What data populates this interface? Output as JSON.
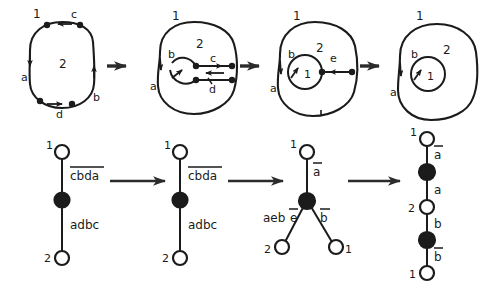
{
  "figure": {
    "row_top": {
      "steps": [
        {
          "id": "top-step-1",
          "region_outer": "1",
          "region_inner": "2",
          "edge_labels": [
            "c",
            "a",
            "b",
            "d"
          ],
          "vertices": 4
        },
        {
          "id": "top-step-2",
          "region_outer": "1",
          "region_inner": "2",
          "edge_labels": [
            "b",
            "c",
            "a",
            "d"
          ],
          "vertices": 4
        },
        {
          "id": "top-step-3",
          "region_outer": "1",
          "region_inner": "2",
          "region_core": "1",
          "edge_labels": [
            "b",
            "e",
            "a"
          ],
          "vertices": 2
        },
        {
          "id": "top-step-4",
          "region_outer": "1",
          "region_inner": "2",
          "region_core": "1",
          "edge_labels": [
            "b",
            "a"
          ],
          "vertices": 0
        }
      ],
      "arrows": [
        "arrow-top-1",
        "arrow-top-2",
        "arrow-top-3"
      ]
    },
    "row_bottom": {
      "steps": [
        {
          "id": "bottom-step-1",
          "type": "chain",
          "nodes": [
            {
              "label": "1",
              "fill": "open"
            },
            {
              "label": "",
              "fill": "solid"
            },
            {
              "label": "2",
              "fill": "open"
            }
          ],
          "edges": [
            {
              "label": "cbda",
              "overline": true
            },
            {
              "label": "adbc",
              "overline": false
            }
          ]
        },
        {
          "id": "bottom-step-2",
          "type": "chain",
          "nodes": [
            {
              "label": "1",
              "fill": "open"
            },
            {
              "label": "",
              "fill": "solid"
            },
            {
              "label": "2",
              "fill": "open"
            }
          ],
          "edges": [
            {
              "label": "cbda",
              "overline": true
            },
            {
              "label": "adbc",
              "overline": false
            }
          ]
        },
        {
          "id": "bottom-step-3",
          "type": "star",
          "nodes": [
            {
              "label": "1",
              "fill": "open",
              "pos": "top"
            },
            {
              "label": "",
              "fill": "solid",
              "pos": "center"
            },
            {
              "label": "2",
              "fill": "open",
              "pos": "bottom-left"
            },
            {
              "label": "1",
              "fill": "open",
              "pos": "bottom-right"
            }
          ],
          "edges": [
            {
              "label": "a",
              "overline": true,
              "branch": "top"
            },
            {
              "label_plain": "aeb",
              "label_overline": "e",
              "branch": "left"
            },
            {
              "label": "b",
              "overline": true,
              "branch": "right"
            }
          ]
        },
        {
          "id": "bottom-step-4",
          "type": "chain",
          "nodes": [
            {
              "label": "1",
              "fill": "open"
            },
            {
              "label": "",
              "fill": "solid"
            },
            {
              "label": "2",
              "fill": "open"
            },
            {
              "label": "",
              "fill": "solid"
            },
            {
              "label": "1",
              "fill": "open"
            }
          ],
          "edges": [
            {
              "label": "a",
              "overline": true
            },
            {
              "label": "a",
              "overline": false
            },
            {
              "label": "b",
              "overline": false
            },
            {
              "label": "b",
              "overline": true
            }
          ]
        }
      ],
      "arrows": [
        "arrow-bottom-1",
        "arrow-bottom-2",
        "arrow-bottom-3"
      ]
    },
    "colors": {
      "ink": "#1b1b1b",
      "background": "#ffffff"
    }
  }
}
